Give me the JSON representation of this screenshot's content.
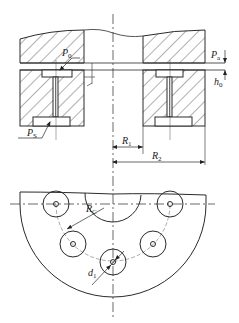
{
  "diagram": {
    "type": "engineering-drawing",
    "colors": {
      "line": "#2a2a2a",
      "hatch": "#3a3a3a",
      "background": "#ffffff"
    },
    "labels": {
      "p0": {
        "main": "P",
        "sub": "0"
      },
      "pa": {
        "main": "P",
        "sub": "a"
      },
      "h0": {
        "main": "h",
        "sub": "0"
      },
      "ps": {
        "main": "P",
        "sub": "S"
      },
      "r1": {
        "main": "R",
        "sub": "1"
      },
      "r2": {
        "main": "R",
        "sub": "2"
      },
      "rc": {
        "main": "R",
        "sub": "C"
      },
      "d1": {
        "main": "d",
        "sub": "1"
      }
    },
    "views": [
      {
        "name": "section-view",
        "description": "cross section showing runner, film gap h0 and bearing pad with recesses and restrictors"
      },
      {
        "name": "plan-view",
        "description": "half-disk bearing with central bore and five recesses on pitch radius Rc"
      }
    ]
  }
}
